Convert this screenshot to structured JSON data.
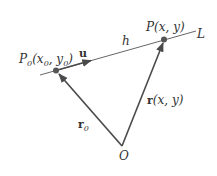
{
  "diagram": {
    "line_label": "L",
    "point_p0": {
      "name": "P",
      "sub": "0",
      "coords_open": "(x",
      "coords_x_sub": "0",
      "coords_mid": ", y",
      "coords_y_sub": "0",
      "coords_close": ")"
    },
    "point_p": {
      "label": "P(x, y)"
    },
    "origin": {
      "label": "O"
    },
    "vector_u": {
      "label": "u"
    },
    "distance": {
      "label": "h"
    },
    "vector_r": {
      "bold": "r",
      "label": "(x, y)"
    },
    "vector_r0": {
      "bold": "r",
      "sub": "0"
    },
    "colors": {
      "line": "#555555",
      "vector": "#4a4a4a",
      "point": "#555555",
      "text": "#333333"
    }
  }
}
